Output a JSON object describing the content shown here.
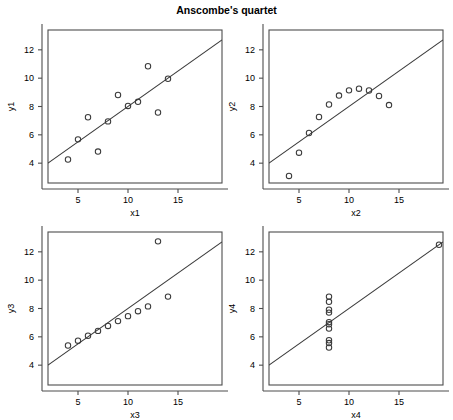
{
  "figure": {
    "title": "Anscombe's quartet",
    "width": 453,
    "height": 420
  },
  "chart_data": [
    {
      "type": "scatter",
      "title": "Anscombe's quartet",
      "panel": 1,
      "xlabel": "x1",
      "ylabel": "y1",
      "xlim": [
        2,
        19.4
      ],
      "ylim": [
        2.6,
        13.4
      ],
      "xticks": [
        5,
        10,
        15
      ],
      "yticks": [
        4,
        6,
        8,
        10,
        12
      ],
      "grid": false,
      "legend": "none",
      "marker": "open-circle",
      "x": [
        10,
        8,
        13,
        9,
        11,
        14,
        6,
        4,
        12,
        7,
        5
      ],
      "y": [
        8.04,
        6.95,
        7.58,
        8.81,
        8.33,
        9.96,
        7.24,
        4.26,
        10.84,
        4.82,
        5.68
      ],
      "fit_line": {
        "intercept": 3.0,
        "slope": 0.5
      }
    },
    {
      "type": "scatter",
      "title": "Anscombe's quartet",
      "panel": 2,
      "xlabel": "x2",
      "ylabel": "y2",
      "xlim": [
        2,
        19.4
      ],
      "ylim": [
        2.6,
        13.4
      ],
      "xticks": [
        5,
        10,
        15
      ],
      "yticks": [
        4,
        6,
        8,
        10,
        12
      ],
      "grid": false,
      "legend": "none",
      "marker": "open-circle",
      "x": [
        10,
        8,
        13,
        9,
        11,
        14,
        6,
        4,
        12,
        7,
        5
      ],
      "y": [
        9.14,
        8.14,
        8.74,
        8.77,
        9.26,
        8.1,
        6.13,
        3.1,
        9.13,
        7.26,
        4.74
      ],
      "fit_line": {
        "intercept": 3.001,
        "slope": 0.5
      }
    },
    {
      "type": "scatter",
      "title": "Anscombe's quartet",
      "panel": 3,
      "xlabel": "x3",
      "ylabel": "y3",
      "xlim": [
        2,
        19.4
      ],
      "ylim": [
        2.6,
        13.4
      ],
      "xticks": [
        5,
        10,
        15
      ],
      "yticks": [
        4,
        6,
        8,
        10,
        12
      ],
      "grid": false,
      "legend": "none",
      "marker": "open-circle",
      "x": [
        10,
        8,
        13,
        9,
        11,
        14,
        6,
        4,
        12,
        7,
        5
      ],
      "y": [
        7.46,
        6.77,
        12.74,
        7.11,
        7.81,
        8.84,
        6.08,
        5.39,
        8.15,
        6.42,
        5.73
      ],
      "fit_line": {
        "intercept": 3.002,
        "slope": 0.4997
      }
    },
    {
      "type": "scatter",
      "title": "Anscombe's quartet",
      "panel": 4,
      "xlabel": "x4",
      "ylabel": "y4",
      "xlim": [
        2,
        19.4
      ],
      "ylim": [
        2.6,
        13.4
      ],
      "xticks": [
        5,
        10,
        15
      ],
      "yticks": [
        4,
        6,
        8,
        10,
        12
      ],
      "grid": false,
      "legend": "none",
      "marker": "open-circle",
      "x": [
        8,
        8,
        8,
        8,
        8,
        8,
        8,
        19,
        8,
        8,
        8
      ],
      "y": [
        6.58,
        5.76,
        7.71,
        8.84,
        8.47,
        7.04,
        5.25,
        12.5,
        5.56,
        7.91,
        6.89
      ],
      "fit_line": {
        "intercept": 3.0017,
        "slope": 0.4999
      }
    }
  ],
  "panels": [
    {
      "name": "panel-1",
      "xlabel": "x1",
      "ylabel": "y1",
      "xtick_labels": [
        "5",
        "10",
        "15"
      ],
      "ytick_labels": [
        "4",
        "6",
        "8",
        "10",
        "12"
      ]
    },
    {
      "name": "panel-2",
      "xlabel": "x2",
      "ylabel": "y2",
      "xtick_labels": [
        "5",
        "10",
        "15"
      ],
      "ytick_labels": [
        "4",
        "6",
        "8",
        "10",
        "12"
      ]
    },
    {
      "name": "panel-3",
      "xlabel": "x3",
      "ylabel": "y3",
      "xtick_labels": [
        "5",
        "10",
        "15"
      ],
      "ytick_labels": [
        "4",
        "6",
        "8",
        "10",
        "12"
      ]
    },
    {
      "name": "panel-4",
      "xlabel": "x4",
      "ylabel": "y4",
      "xtick_labels": [
        "5",
        "10",
        "15"
      ],
      "ytick_labels": [
        "4",
        "6",
        "8",
        "10",
        "12"
      ]
    }
  ]
}
